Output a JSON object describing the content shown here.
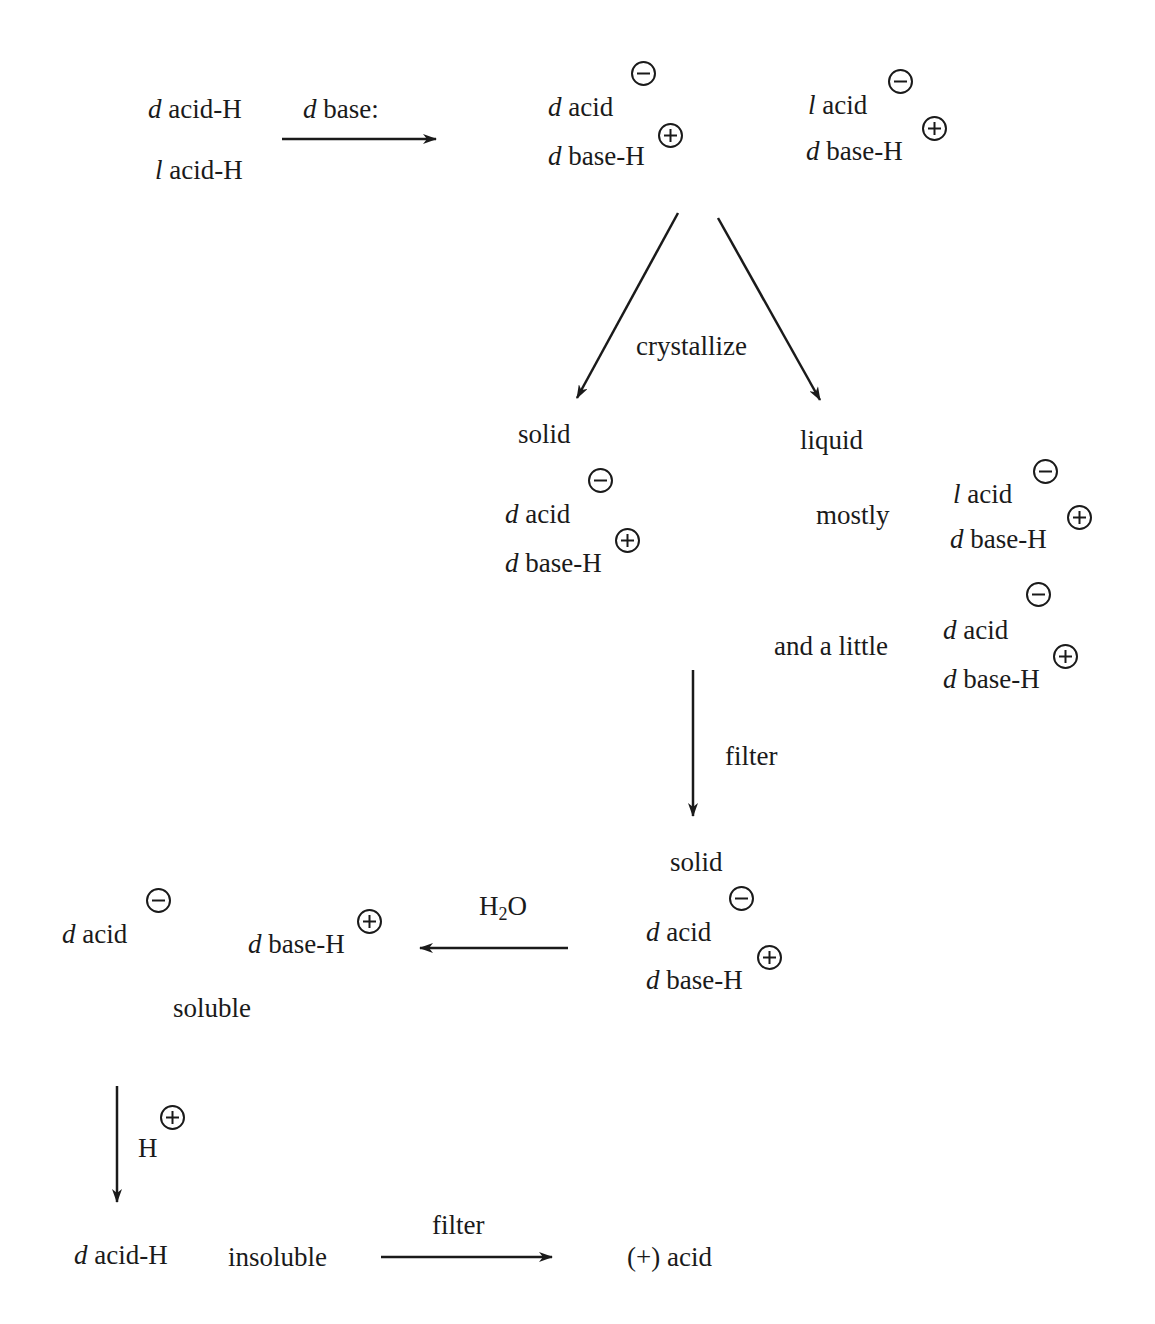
{
  "diagram": {
    "colors": {
      "ink": "#1a1a1a",
      "background": "#ffffff"
    },
    "nodes": {
      "start_d": {
        "prefix": "d",
        "text": " acid-H"
      },
      "start_l": {
        "prefix": "l",
        "text": " acid-H"
      },
      "reagent_base": {
        "prefix": "d",
        "text": " base:"
      },
      "salt1_acid": {
        "prefix": "d",
        "text": " acid",
        "charge": "minus"
      },
      "salt1_base": {
        "prefix": "d",
        "text": " base-H",
        "charge": "plus"
      },
      "salt2_acid": {
        "prefix": "l",
        "text": " acid",
        "charge": "minus"
      },
      "salt2_base": {
        "prefix": "d",
        "text": " base-H",
        "charge": "plus"
      },
      "crystallize_label": "crystallize",
      "solid_label": "solid",
      "liquid_label": "liquid",
      "solid_acid": {
        "prefix": "d",
        "text": " acid",
        "charge": "minus"
      },
      "solid_base": {
        "prefix": "d",
        "text": " base-H",
        "charge": "plus"
      },
      "mostly_label": "mostly",
      "mostly_acid": {
        "prefix": "l",
        "text": " acid",
        "charge": "minus"
      },
      "mostly_base": {
        "prefix": "d",
        "text": " base-H",
        "charge": "plus"
      },
      "little_label": "and a little",
      "little_acid": {
        "prefix": "d",
        "text": " acid",
        "charge": "minus"
      },
      "little_base": {
        "prefix": "d",
        "text": " base-H",
        "charge": "plus"
      },
      "filter1_label": "filter",
      "solid2_label": "solid",
      "solid2_acid": {
        "prefix": "d",
        "text": " acid",
        "charge": "minus"
      },
      "solid2_base": {
        "prefix": "d",
        "text": " base-H",
        "charge": "plus"
      },
      "water_label": {
        "h": "H",
        "sub": "2",
        "o": "O"
      },
      "free_acid": {
        "prefix": "d",
        "text": " acid",
        "charge": "minus"
      },
      "free_base": {
        "prefix": "d",
        "text": " base-H",
        "charge": "plus"
      },
      "soluble_label": "soluble",
      "proton_label": {
        "text": "H",
        "charge": "plus"
      },
      "final_acid_h": {
        "prefix": "d",
        "text": " acid-H"
      },
      "insoluble_label": "insoluble",
      "filter2_label": "filter",
      "product": "(+) acid"
    },
    "arrows": [
      {
        "id": "base-addition",
        "from": "racemic acid",
        "to": "diastereomeric salts",
        "direction": "right"
      },
      {
        "id": "crystallize-solid",
        "from": "salts",
        "to": "solid",
        "direction": "down-left"
      },
      {
        "id": "crystallize-liquid",
        "from": "salts",
        "to": "liquid",
        "direction": "down-right"
      },
      {
        "id": "filter-1",
        "from": "liquid mixture",
        "to": "solid",
        "direction": "down"
      },
      {
        "id": "water",
        "from": "solid salt",
        "to": "free ions",
        "direction": "left"
      },
      {
        "id": "acidify",
        "from": "soluble ions",
        "to": "d acid-H",
        "direction": "down"
      },
      {
        "id": "filter-2",
        "from": "insoluble acid",
        "to": "(+) acid",
        "direction": "right"
      }
    ]
  }
}
